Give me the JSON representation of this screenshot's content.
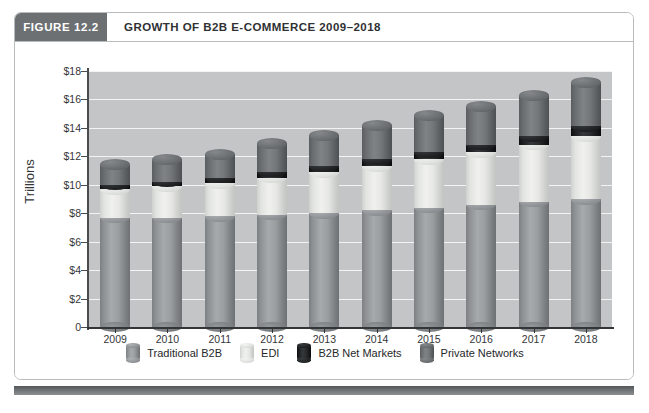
{
  "figure": {
    "number_label": "FIGURE 12.2",
    "title": "GROWTH OF B2B E-COMMERCE 2009–2018"
  },
  "colors": {
    "header_box": "#6d7073",
    "plot_background": "#c3c5c6",
    "gridline": "#f2f3f3",
    "axis": "#333537",
    "traditional_b2b": "#8e9194",
    "edi": "#e7e8e5",
    "b2b_net_markets": "#1a1c1d",
    "private_networks": "#6b6e71"
  },
  "chart_data": {
    "type": "bar",
    "stacked": true,
    "title": "GROWTH OF B2B E-COMMERCE 2009–2018",
    "xlabel": "",
    "ylabel": "Trillions",
    "ylim": [
      0,
      18
    ],
    "yticks": [
      0,
      2,
      4,
      6,
      8,
      10,
      12,
      14,
      16,
      18
    ],
    "ytick_labels": [
      "0",
      "$2",
      "$4",
      "$6",
      "$8",
      "$10",
      "$12",
      "$14",
      "$16",
      "$18"
    ],
    "grid": true,
    "legend_position": "bottom",
    "categories": [
      "2009",
      "2010",
      "2011",
      "2012",
      "2013",
      "2014",
      "2015",
      "2016",
      "2017",
      "2018"
    ],
    "series": [
      {
        "name": "Traditional B2B",
        "color": "#8e9194",
        "values": [
          7.7,
          7.7,
          7.8,
          7.9,
          8.0,
          8.2,
          8.4,
          8.6,
          8.8,
          9.0
        ]
      },
      {
        "name": "EDI",
        "color": "#e7e8e5",
        "values": [
          2.0,
          2.2,
          2.3,
          2.6,
          2.9,
          3.1,
          3.4,
          3.7,
          4.0,
          4.4
        ]
      },
      {
        "name": "B2B Net Markets",
        "color": "#1a1c1d",
        "values": [
          0.3,
          0.3,
          0.4,
          0.4,
          0.4,
          0.5,
          0.5,
          0.5,
          0.6,
          0.7
        ]
      },
      {
        "name": "Private Networks",
        "color": "#6b6e71",
        "values": [
          1.4,
          1.6,
          1.6,
          2.0,
          2.2,
          2.4,
          2.6,
          2.7,
          2.9,
          3.1
        ]
      }
    ],
    "totals": [
      11.4,
      11.8,
      12.1,
      12.9,
      13.5,
      14.2,
      14.9,
      15.5,
      16.3,
      17.2
    ]
  },
  "legend": {
    "items": [
      {
        "label": "Traditional B2B",
        "swatch": "traditional-b2b"
      },
      {
        "label": "EDI",
        "swatch": "edi"
      },
      {
        "label": "B2B Net Markets",
        "swatch": "b2b-net-markets"
      },
      {
        "label": "Private Networks",
        "swatch": "private-networks"
      }
    ]
  }
}
